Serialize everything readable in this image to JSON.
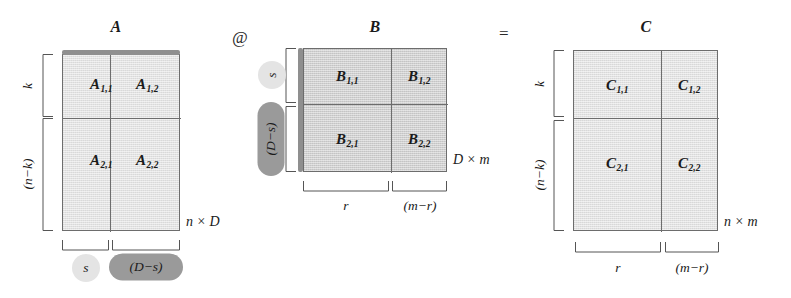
{
  "figure": {
    "operators": {
      "matmul": "@",
      "equals": "="
    }
  },
  "matrices": [
    {
      "id": "A",
      "title": "A",
      "size_label": "n × D",
      "blocks": [
        {
          "name": "A",
          "sub": "1,1"
        },
        {
          "name": "A",
          "sub": "1,2"
        },
        {
          "name": "A",
          "sub": "2,1"
        },
        {
          "name": "A",
          "sub": "2,2"
        }
      ],
      "row_labels": [
        "k",
        "(n−k)"
      ],
      "col_labels": [
        "s",
        "(D−s)"
      ]
    },
    {
      "id": "B",
      "title": "B",
      "size_label": "D × m",
      "blocks": [
        {
          "name": "B",
          "sub": "1,1"
        },
        {
          "name": "B",
          "sub": "1,2"
        },
        {
          "name": "B",
          "sub": "2,1"
        },
        {
          "name": "B",
          "sub": "2,2"
        }
      ],
      "row_labels": [
        "s",
        "(D−s)"
      ],
      "col_labels": [
        "r",
        "(m−r)"
      ]
    },
    {
      "id": "C",
      "title": "C",
      "size_label": "n × m",
      "blocks": [
        {
          "name": "C",
          "sub": "1,1"
        },
        {
          "name": "C",
          "sub": "1,2"
        },
        {
          "name": "C",
          "sub": "2,1"
        },
        {
          "name": "C",
          "sub": "2,2"
        }
      ],
      "row_labels": [
        "k",
        "(n−k)"
      ],
      "col_labels": [
        "r",
        "(m−r)"
      ]
    }
  ],
  "colors": {
    "fill_light": "#e2e2e2",
    "fill_dark": "#cfcfcf",
    "border": "#6d6d6d",
    "accent": "#8f8f8f",
    "chip_light": "#e4e4e4",
    "chip_dark": "#9a9a9a",
    "text": "#1a1a1a"
  }
}
